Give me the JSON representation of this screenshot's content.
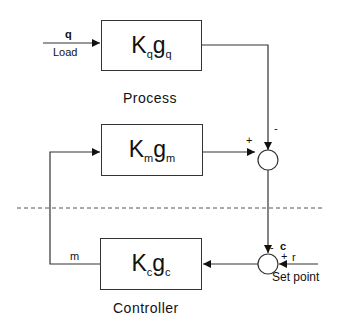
{
  "diagram": {
    "type": "feedback-control-block-diagram",
    "blocks": {
      "process_load": {
        "K": "K",
        "K_sub": "q",
        "g": "g",
        "g_sub": "q",
        "caption": "Process"
      },
      "measurement": {
        "K": "K",
        "K_sub": "m",
        "g": "g",
        "g_sub": "m"
      },
      "controller": {
        "K": "K",
        "K_sub": "c",
        "g": "g",
        "g_sub": "c",
        "caption": "Controller"
      }
    },
    "signals": {
      "load_symbol": "q",
      "load_label": "Load",
      "manipulated": "m",
      "controlled": "c",
      "setpoint_symbol": "r",
      "setpoint_label": "Set point"
    },
    "junctions": {
      "upper": {
        "left_sign": "+",
        "top_sign": "-"
      },
      "lower": {
        "top_sign": "-",
        "right_sign": "+"
      }
    }
  }
}
